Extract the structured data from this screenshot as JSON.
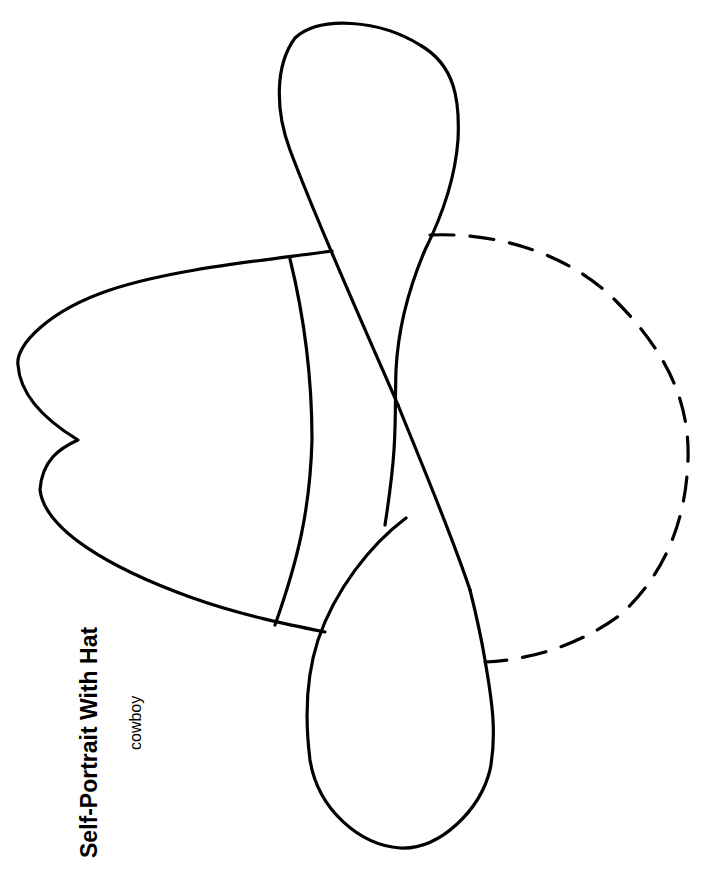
{
  "worksheet": {
    "title": "Self-Portrait With Hat",
    "subtitle": "cowboy",
    "orientation": "rotated -90deg (landscape printed on portrait page)"
  },
  "illustration": {
    "subject": "cowboy-hat-outline",
    "parts": [
      "hat-crown",
      "hat-band",
      "hat-brim-top-lobe",
      "hat-brim-bottom-lobe",
      "face-dashed-outline"
    ],
    "stroke_color": "#000000",
    "background_color": "#ffffff"
  }
}
